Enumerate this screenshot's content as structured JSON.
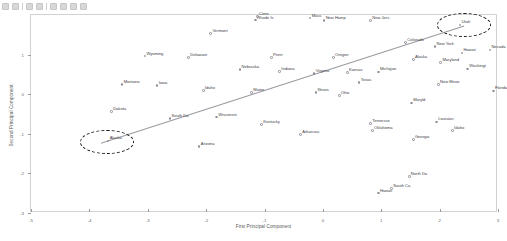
{
  "toolbar": {
    "buttons": [
      "new-icon",
      "open-icon",
      "save-icon",
      "zoom-in-icon",
      "zoom-out-icon",
      "pan-icon",
      "config-icon",
      "export-icon"
    ]
  },
  "chart_data": {
    "type": "scatter",
    "title": "",
    "xlabel": "First Principal Component",
    "ylabel": "Second Principal Component",
    "xlim": [
      -5,
      3
    ],
    "ylim": [
      -3,
      2
    ],
    "xticks": [
      -5,
      -4,
      -3,
      -2,
      -1,
      0,
      1,
      2,
      3
    ],
    "xticklabels": [
      "-5",
      "-4",
      "-3",
      "-2",
      "-1",
      "0",
      "1",
      "2",
      "3"
    ],
    "yticks": [
      -3,
      -2,
      -1,
      0,
      1,
      2
    ],
    "yticklabels": [
      "-3",
      "-2",
      "-1",
      "0",
      "1",
      "2"
    ],
    "grid": false,
    "legend": null,
    "points": [
      {
        "label": "Rhode Is",
        "x": -1.15,
        "y": 1.87
      },
      {
        "label": "Conn",
        "x": -1.12,
        "y": 1.96
      },
      {
        "label": "Mass",
        "x": -0.22,
        "y": 1.92
      },
      {
        "label": "New Hamp",
        "x": 0.02,
        "y": 1.86
      },
      {
        "label": "New Jers",
        "x": 0.82,
        "y": 1.86
      },
      {
        "label": "Vermont",
        "x": -1.92,
        "y": 1.53
      },
      {
        "label": "Utah",
        "x": 2.35,
        "y": 1.75
      },
      {
        "label": "Colorado",
        "x": 1.42,
        "y": 1.31
      },
      {
        "label": "New York",
        "x": 1.92,
        "y": 1.2
      },
      {
        "label": "Nevada",
        "x": 2.86,
        "y": 1.12
      },
      {
        "label": "Hawaii",
        "x": 2.38,
        "y": 1.04
      },
      {
        "label": "Wyoming",
        "x": -3.05,
        "y": 0.96
      },
      {
        "label": "Delaware",
        "x": -2.3,
        "y": 0.92
      },
      {
        "label": "Penn",
        "x": -0.88,
        "y": 0.93
      },
      {
        "label": "Oregon",
        "x": 0.18,
        "y": 0.92
      },
      {
        "label": "Alaska",
        "x": 1.55,
        "y": 0.88
      },
      {
        "label": "Maryland",
        "x": 2.02,
        "y": 0.8
      },
      {
        "label": "Washingt",
        "x": 2.48,
        "y": 0.64
      },
      {
        "label": "Nebraska",
        "x": -1.42,
        "y": 0.62
      },
      {
        "label": "Indiana",
        "x": -0.74,
        "y": 0.57
      },
      {
        "label": "Virginia",
        "x": -0.15,
        "y": 0.52
      },
      {
        "label": "Kansas",
        "x": 0.42,
        "y": 0.55
      },
      {
        "label": "Michigan",
        "x": 0.95,
        "y": 0.56
      },
      {
        "label": "Montana",
        "x": -3.44,
        "y": 0.24
      },
      {
        "label": "New Mexic",
        "x": 1.98,
        "y": 0.25
      },
      {
        "label": "Texas",
        "x": 0.62,
        "y": 0.3
      },
      {
        "label": "Iowa",
        "x": -2.84,
        "y": 0.22
      },
      {
        "label": "Idaho",
        "x": -2.05,
        "y": 0.1
      },
      {
        "label": "Maine",
        "x": -1.22,
        "y": 0.04
      },
      {
        "label": "Florida",
        "x": 2.92,
        "y": 0.08
      },
      {
        "label": "Illinois",
        "x": -0.12,
        "y": 0.04
      },
      {
        "label": "Ohio",
        "x": 0.28,
        "y": -0.04
      },
      {
        "label": "Maryld",
        "x": 1.52,
        "y": -0.22
      },
      {
        "label": "Dakota",
        "x": -3.62,
        "y": -0.44
      },
      {
        "label": "South Da",
        "x": -2.62,
        "y": -0.62
      },
      {
        "label": "Wisconsin",
        "x": -1.82,
        "y": -0.58
      },
      {
        "label": "Tennesse",
        "x": 0.82,
        "y": -0.74
      },
      {
        "label": "Louisian",
        "x": 1.95,
        "y": -0.7
      },
      {
        "label": "Kentucky",
        "x": -1.05,
        "y": -0.76
      },
      {
        "label": "Oklahoma",
        "x": 0.85,
        "y": -0.92
      },
      {
        "label": "Idaho",
        "x": 2.22,
        "y": -0.92
      },
      {
        "label": "Arkansas",
        "x": -0.38,
        "y": -1.02
      },
      {
        "label": "Georgia",
        "x": 1.55,
        "y": -1.14
      },
      {
        "label": "Alaska",
        "x": -3.68,
        "y": -1.18
      },
      {
        "label": "Arizona",
        "x": -2.12,
        "y": -1.32
      },
      {
        "label": "North Da",
        "x": 1.48,
        "y": -2.08
      },
      {
        "label": "South Ca",
        "x": 1.18,
        "y": -2.38
      },
      {
        "label": "Hawaii",
        "x": 0.95,
        "y": -2.5
      }
    ],
    "trend_line": {
      "x0": -3.8,
      "y0": -1.24,
      "x1": 2.42,
      "y1": 1.72,
      "color": "#9a9aa2"
    },
    "annotations": [
      {
        "name": "outlier-high-ellipse",
        "cx": 2.42,
        "cy": 1.74,
        "rx": 0.46,
        "ry": 0.3,
        "style": "dashed-ellipse"
      },
      {
        "name": "outlier-low-ellipse",
        "cx": -3.7,
        "cy": -1.2,
        "rx": 0.46,
        "ry": 0.3,
        "style": "dashed-ellipse"
      }
    ]
  }
}
